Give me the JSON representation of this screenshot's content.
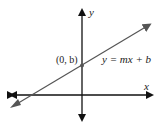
{
  "diagram": {
    "axes": {
      "x_label": "x",
      "y_label": "y"
    },
    "line": {
      "equation": "y = mx + b",
      "color": "#555555"
    },
    "point": {
      "label": "(0, b)",
      "color": "#555555"
    },
    "axis_color": "#111111"
  }
}
